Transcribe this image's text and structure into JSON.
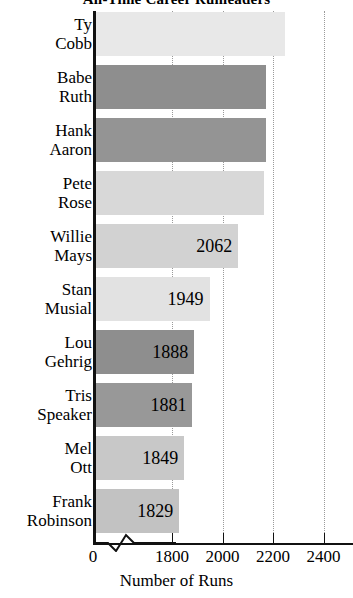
{
  "chart_data": {
    "type": "bar",
    "orientation": "horizontal",
    "title": "All-Time Career Runleaders",
    "xlabel": "Number of Runs",
    "ylabel": "",
    "xlim": [
      1750,
      2400
    ],
    "axis_break": true,
    "axis_break_note": "axis broken between 0 and 1800",
    "grid": true,
    "grid_axis": "x",
    "grid_style": "dotted",
    "legend": "none",
    "xticks": [
      0,
      1800,
      2000,
      2200,
      2400
    ],
    "xticklabels": [
      "0",
      "1800",
      "2000",
      "2200",
      "2400"
    ],
    "categories": [
      "Ty Cobb",
      "Babe Ruth",
      "Hank Aaron",
      "Pete Rose",
      "Willie Mays",
      "Stan Musial",
      "Lou Gehrig",
      "Tris Speaker",
      "Mel Ott",
      "Frank Robinson"
    ],
    "values": [
      2246,
      2174,
      2174,
      2165,
      2062,
      1949,
      1888,
      1881,
      1849,
      1829
    ],
    "bars": [
      {
        "name": "Ty Cobb",
        "label_line1": "Ty",
        "label_line2": "Cobb",
        "value": 2246,
        "value_label": "",
        "color": "#e8e8e8"
      },
      {
        "name": "Babe Ruth",
        "label_line1": "Babe",
        "label_line2": "Ruth",
        "value": 2174,
        "value_label": "",
        "color": "#8e8e8e"
      },
      {
        "name": "Hank Aaron",
        "label_line1": "Hank",
        "label_line2": "Aaron",
        "value": 2174,
        "value_label": "",
        "color": "#949494"
      },
      {
        "name": "Pete Rose",
        "label_line1": "Pete",
        "label_line2": "Rose",
        "value": 2165,
        "value_label": "",
        "color": "#d8d8d8"
      },
      {
        "name": "Willie Mays",
        "label_line1": "Willie",
        "label_line2": "Mays",
        "value": 2062,
        "value_label": "2062",
        "color": "#d2d2d2"
      },
      {
        "name": "Stan Musial",
        "label_line1": "Stan",
        "label_line2": "Musial",
        "value": 1949,
        "value_label": "1949",
        "color": "#e2e2e2"
      },
      {
        "name": "Lou Gehrig",
        "label_line1": "Lou",
        "label_line2": "Gehrig",
        "value": 1888,
        "value_label": "1888",
        "color": "#8e8e8e"
      },
      {
        "name": "Tris Speaker",
        "label_line1": "Tris",
        "label_line2": "Speaker",
        "value": 1881,
        "value_label": "1881",
        "color": "#989898"
      },
      {
        "name": "Mel Ott",
        "label_line1": "Mel",
        "label_line2": "Ott",
        "value": 1849,
        "value_label": "1849",
        "color": "#c8c8c8"
      },
      {
        "name": "Frank Robinson",
        "label_line1": "Frank",
        "label_line2": "Robinson",
        "value": 1829,
        "value_label": "1829",
        "color": "#c2c2c2"
      }
    ]
  },
  "colors": {
    "axis": "#111111",
    "grid": "#9a9a9a",
    "background": "#ffffff",
    "text": "#000000"
  }
}
